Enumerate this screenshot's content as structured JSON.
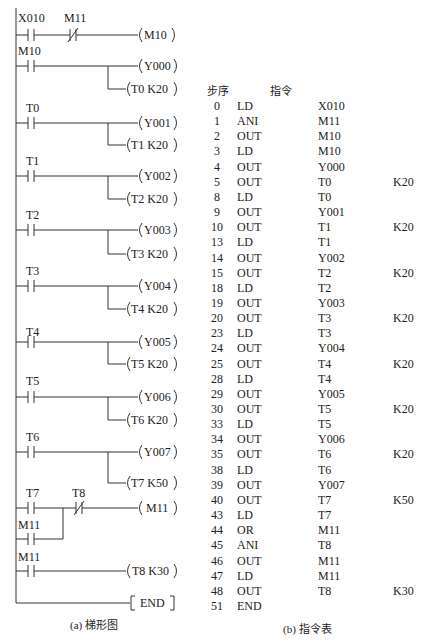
{
  "ladder": {
    "caption": "(a) 梯形图",
    "rungs": [
      {
        "contacts": [
          {
            "name": "X010",
            "type": "NO"
          },
          {
            "name": "M11",
            "type": "NC"
          }
        ],
        "outputs": [
          "M10"
        ]
      },
      {
        "contacts": [
          {
            "name": "M10",
            "type": "NO"
          }
        ],
        "outputs": [
          "Y000",
          "T0 K20"
        ]
      },
      {
        "contacts": [
          {
            "name": "T0",
            "type": "NO"
          }
        ],
        "outputs": [
          "Y001",
          "T1 K20"
        ]
      },
      {
        "contacts": [
          {
            "name": "T1",
            "type": "NO"
          }
        ],
        "outputs": [
          "Y002",
          "T2 K20"
        ]
      },
      {
        "contacts": [
          {
            "name": "T2",
            "type": "NO"
          }
        ],
        "outputs": [
          "Y003",
          "T3 K20"
        ]
      },
      {
        "contacts": [
          {
            "name": "T3",
            "type": "NO"
          }
        ],
        "outputs": [
          "Y004",
          "T4 K20"
        ]
      },
      {
        "contacts": [
          {
            "name": "T4",
            "type": "NO"
          }
        ],
        "outputs": [
          "Y005",
          "T5 K20"
        ]
      },
      {
        "contacts": [
          {
            "name": "T5",
            "type": "NO"
          }
        ],
        "outputs": [
          "Y006",
          "T6 K20"
        ]
      },
      {
        "contacts": [
          {
            "name": "T6",
            "type": "NO"
          }
        ],
        "outputs": [
          "Y007",
          "T7 K50"
        ]
      },
      {
        "contacts": [
          {
            "name": "T7",
            "type": "NO"
          },
          {
            "name": "T8",
            "type": "NC"
          }
        ],
        "parallel": {
          "name": "M11",
          "type": "NO"
        },
        "outputs": [
          "M11"
        ]
      },
      {
        "contacts": [
          {
            "name": "M11",
            "type": "NO"
          }
        ],
        "outputs": [
          "T8 K30"
        ]
      }
    ],
    "end_label": "END",
    "labels": {
      "r0c0": "X010",
      "r0c1": "M11",
      "r0o0": "M10",
      "r1c0": "M10",
      "r1o0": "Y000",
      "r1o1": "T0 K20",
      "r2c0": "T0",
      "r2o0": "Y001",
      "r2o1": "T1 K20",
      "r3c0": "T1",
      "r3o0": "Y002",
      "r3o1": "T2 K20",
      "r4c0": "T2",
      "r4o0": "Y003",
      "r4o1": "T3 K20",
      "r5c0": "T3",
      "r5o0": "Y004",
      "r5o1": "T4 K20",
      "r6c0": "T4",
      "r6o0": "Y005",
      "r6o1": "T5 K20",
      "r7c0": "T5",
      "r7o0": "Y006",
      "r7o1": "T6 K20",
      "r8c0": "T6",
      "r8o0": "Y007",
      "r8o1": "T7 K50",
      "r9c0": "T7",
      "r9c1": "T8",
      "r9p": "M11",
      "r9o0": "M11",
      "r10c0": "M11",
      "r10o0": "T8 K30"
    }
  },
  "instruction_table": {
    "caption": "(b) 指令表",
    "headers": {
      "step": "步序",
      "instruction": "指令"
    },
    "rows": [
      {
        "step": "0",
        "op": "LD",
        "dev": "X010",
        "k": ""
      },
      {
        "step": "1",
        "op": "ANI",
        "dev": "M11",
        "k": ""
      },
      {
        "step": "2",
        "op": "OUT",
        "dev": "M10",
        "k": ""
      },
      {
        "step": "3",
        "op": "LD",
        "dev": "M10",
        "k": ""
      },
      {
        "step": "4",
        "op": "OUT",
        "dev": "Y000",
        "k": ""
      },
      {
        "step": "5",
        "op": "OUT",
        "dev": "T0",
        "k": "K20"
      },
      {
        "step": "8",
        "op": "LD",
        "dev": "T0",
        "k": ""
      },
      {
        "step": "9",
        "op": "OUT",
        "dev": "Y001",
        "k": ""
      },
      {
        "step": "10",
        "op": "OUT",
        "dev": "T1",
        "k": "K20"
      },
      {
        "step": "13",
        "op": "LD",
        "dev": "T1",
        "k": ""
      },
      {
        "step": "14",
        "op": "OUT",
        "dev": "Y002",
        "k": ""
      },
      {
        "step": "15",
        "op": "OUT",
        "dev": "T2",
        "k": "K20"
      },
      {
        "step": "18",
        "op": "LD",
        "dev": "T2",
        "k": ""
      },
      {
        "step": "19",
        "op": "OUT",
        "dev": "Y003",
        "k": ""
      },
      {
        "step": "20",
        "op": "OUT",
        "dev": "T3",
        "k": "K20"
      },
      {
        "step": "23",
        "op": "LD",
        "dev": "T3",
        "k": ""
      },
      {
        "step": "24",
        "op": "OUT",
        "dev": "Y004",
        "k": ""
      },
      {
        "step": "25",
        "op": "OUT",
        "dev": "T4",
        "k": "K20"
      },
      {
        "step": "28",
        "op": "LD",
        "dev": "T4",
        "k": ""
      },
      {
        "step": "29",
        "op": "OUT",
        "dev": "Y005",
        "k": ""
      },
      {
        "step": "30",
        "op": "OUT",
        "dev": "T5",
        "k": "K20"
      },
      {
        "step": "33",
        "op": "LD",
        "dev": "T5",
        "k": ""
      },
      {
        "step": "34",
        "op": "OUT",
        "dev": "Y006",
        "k": ""
      },
      {
        "step": "35",
        "op": "OUT",
        "dev": "T6",
        "k": "K20"
      },
      {
        "step": "38",
        "op": "LD",
        "dev": "T6",
        "k": ""
      },
      {
        "step": "39",
        "op": "OUT",
        "dev": "Y007",
        "k": ""
      },
      {
        "step": "40",
        "op": "OUT",
        "dev": "T7",
        "k": "K50"
      },
      {
        "step": "43",
        "op": "LD",
        "dev": "T7",
        "k": ""
      },
      {
        "step": "44",
        "op": "OR",
        "dev": "M11",
        "k": ""
      },
      {
        "step": "45",
        "op": "ANI",
        "dev": "T8",
        "k": ""
      },
      {
        "step": "46",
        "op": "OUT",
        "dev": "M11",
        "k": ""
      },
      {
        "step": "47",
        "op": "LD",
        "dev": "M11",
        "k": ""
      },
      {
        "step": "48",
        "op": "OUT",
        "dev": "T8",
        "k": "K30"
      },
      {
        "step": "51",
        "op": "END",
        "dev": "",
        "k": ""
      }
    ]
  }
}
